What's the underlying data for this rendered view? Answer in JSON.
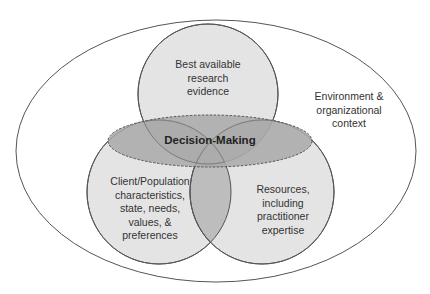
{
  "diagram": {
    "type": "venn",
    "outer_context": {
      "lines": [
        "Environment &",
        "organizational",
        "context"
      ]
    },
    "circles": [
      {
        "id": "evidence",
        "lines": [
          "Best available",
          "research",
          "evidence"
        ]
      },
      {
        "id": "client",
        "lines": [
          "Client/Population",
          "characteristics,",
          "state, needs,",
          "values, &",
          "preferences"
        ]
      },
      {
        "id": "resources",
        "lines": [
          "Resources,",
          "including",
          "practitioner",
          "expertise"
        ]
      }
    ],
    "center": {
      "label": "Decision-Making",
      "style": "dashed-ellipse"
    },
    "colors": {
      "circle_fill": "#e4e4e4",
      "overlap_fill": "#bdbdbd",
      "center_fill": "#a9a9a9",
      "stroke": "#555555"
    }
  }
}
